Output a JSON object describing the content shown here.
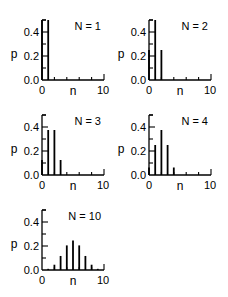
{
  "chart_data": [
    {
      "type": "bar",
      "title": "N = 1",
      "xlabel": "n",
      "ylabel": "p",
      "x": [
        0,
        1
      ],
      "values": [
        0.5,
        0.5
      ],
      "xlim": [
        0,
        10
      ],
      "ylim": [
        0,
        0.5
      ],
      "xticks": [
        "0",
        "10"
      ],
      "yticks": [
        "0.0",
        "0.2",
        "0.4"
      ],
      "grid": false,
      "legend": null
    },
    {
      "type": "bar",
      "title": "N = 2",
      "xlabel": "n",
      "ylabel": "p",
      "x": [
        0,
        1,
        2
      ],
      "values": [
        0.25,
        0.5,
        0.25
      ],
      "xlim": [
        0,
        10
      ],
      "ylim": [
        0,
        0.5
      ],
      "xticks": [
        "0",
        "10"
      ],
      "yticks": [
        "0.0",
        "0.2",
        "0.4"
      ],
      "grid": false,
      "legend": null
    },
    {
      "type": "bar",
      "title": "N = 3",
      "xlabel": "n",
      "ylabel": "p",
      "x": [
        0,
        1,
        2,
        3
      ],
      "values": [
        0.125,
        0.375,
        0.375,
        0.125
      ],
      "xlim": [
        0,
        10
      ],
      "ylim": [
        0,
        0.5
      ],
      "xticks": [
        "0",
        "10"
      ],
      "yticks": [
        "0.0",
        "0.2",
        "0.4"
      ],
      "grid": false,
      "legend": null
    },
    {
      "type": "bar",
      "title": "N = 4",
      "xlabel": "n",
      "ylabel": "p",
      "x": [
        0,
        1,
        2,
        3,
        4
      ],
      "values": [
        0.0625,
        0.25,
        0.375,
        0.25,
        0.0625
      ],
      "xlim": [
        0,
        10
      ],
      "ylim": [
        0,
        0.5
      ],
      "xticks": [
        "0",
        "10"
      ],
      "yticks": [
        "0.0",
        "0.2",
        "0.4"
      ],
      "grid": false,
      "legend": null
    },
    {
      "type": "bar",
      "title": "N = 10",
      "xlabel": "n",
      "ylabel": "p",
      "x": [
        0,
        1,
        2,
        3,
        4,
        5,
        6,
        7,
        8,
        9,
        10
      ],
      "values": [
        0.001,
        0.0098,
        0.044,
        0.117,
        0.205,
        0.246,
        0.205,
        0.117,
        0.044,
        0.0098,
        0.001
      ],
      "xlim": [
        0,
        10
      ],
      "ylim": [
        0,
        0.5
      ],
      "xticks": [
        "0",
        "10"
      ],
      "yticks": [
        "0.0",
        "0.2",
        "0.4"
      ],
      "grid": false,
      "legend": null
    }
  ],
  "layout": {
    "panels": [
      {
        "ox": 42,
        "base": 80
      },
      {
        "ox": 149,
        "base": 80
      },
      {
        "ox": 42,
        "base": 175
      },
      {
        "ox": 149,
        "base": 175
      },
      {
        "ox": 42,
        "base": 270
      }
    ],
    "xscale": 6.2,
    "yscale": 120,
    "bar_color": "#000000"
  }
}
